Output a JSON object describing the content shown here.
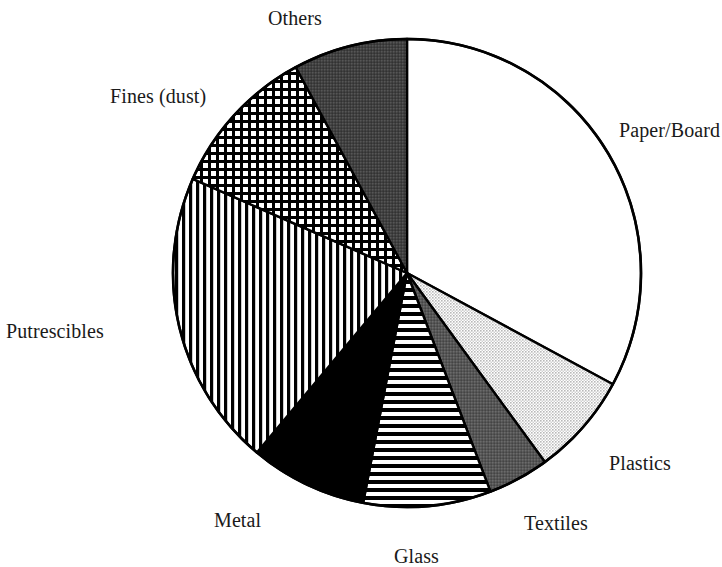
{
  "figure": {
    "background_color": "#ffffff",
    "outline_color": "#000000",
    "label_color": "#1a1a1a"
  },
  "labels": {
    "paper_board": "Paper/Board",
    "plastics": "Plastics",
    "textiles": "Textiles",
    "glass": "Glass",
    "metal": "Metal",
    "putrescibles": "Putrescibles",
    "fines_dust": "Fines (dust)",
    "others": "Others"
  },
  "chart_data": {
    "type": "pie",
    "title": "",
    "subtitle": "",
    "xlabel": "",
    "ylabel": "",
    "legend_position": "none",
    "labels_position": "outside-callout",
    "grid": false,
    "start_angle_deg": 0,
    "direction": "clockwise",
    "center_px": [
      407,
      273
    ],
    "radius_px": 234,
    "categories": [
      "Paper/Board",
      "Plastics",
      "Textiles",
      "Glass",
      "Metal",
      "Putrescibles",
      "Fines (dust)",
      "Others"
    ],
    "values": [
      32.9,
      7.1,
      4.2,
      8.8,
      8.1,
      20.5,
      10.5,
      7.9
    ],
    "value_unit": "percent",
    "slices": [
      {
        "label": "Paper/Board",
        "percent": 32.9,
        "start_angle_deg": 0.0,
        "end_angle_deg": 118.4,
        "sweep_deg": 118.4,
        "fill": "white",
        "fill_color": "#ffffff",
        "pattern": "none"
      },
      {
        "label": "Plastics",
        "percent": 7.1,
        "start_angle_deg": 118.4,
        "end_angle_deg": 143.9,
        "sweep_deg": 25.5,
        "fill": "light-stipple",
        "fill_color": "#d4d4d4",
        "pattern": "fine-dot-stipple"
      },
      {
        "label": "Textiles",
        "percent": 4.2,
        "start_angle_deg": 143.9,
        "end_angle_deg": 159.1,
        "sweep_deg": 15.2,
        "fill": "dark-gray",
        "fill_color": "#5e5e5e",
        "pattern": "solid-gray"
      },
      {
        "label": "Glass",
        "percent": 8.8,
        "start_angle_deg": 159.1,
        "end_angle_deg": 190.8,
        "sweep_deg": 31.7,
        "fill": "horizontal-lines",
        "fill_color": "#000000",
        "pattern": "horizontal-hatch"
      },
      {
        "label": "Metal",
        "percent": 8.1,
        "start_angle_deg": 190.8,
        "end_angle_deg": 219.9,
        "sweep_deg": 29.1,
        "fill": "black",
        "fill_color": "#000000",
        "pattern": "solid-black"
      },
      {
        "label": "Putrescibles",
        "percent": 20.5,
        "start_angle_deg": 219.9,
        "end_angle_deg": 293.7,
        "sweep_deg": 73.8,
        "fill": "vertical-lines",
        "fill_color": "#000000",
        "pattern": "vertical-hatch"
      },
      {
        "label": "Fines (dust)",
        "percent": 10.5,
        "start_angle_deg": 293.7,
        "end_angle_deg": 331.6,
        "sweep_deg": 37.9,
        "fill": "grid-crosshatch",
        "fill_color": "#000000",
        "pattern": "grid-crosshatch"
      },
      {
        "label": "Others",
        "percent": 7.9,
        "start_angle_deg": 331.6,
        "end_angle_deg": 360.0,
        "sweep_deg": 28.4,
        "fill": "charcoal",
        "fill_color": "#4a4a4a",
        "pattern": "solid-charcoal"
      }
    ]
  }
}
